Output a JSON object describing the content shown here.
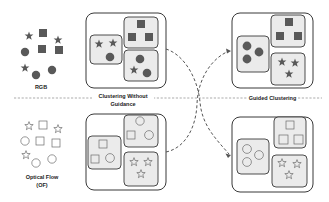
{
  "labels": {
    "rgb": "RGB",
    "optical_flow_line1": "Optical Flow",
    "optical_flow_line2": "(OF)",
    "clustering_without_line1": "Clustering Without",
    "clustering_without_line2": "Guidance",
    "guided_clustering": "Guided Clustering"
  },
  "colors": {
    "filled_shape": "#595959",
    "outline_shape": "#6b6b6b",
    "cluster_fill": "#ebebeb",
    "panel_border": "#222222",
    "dashed": "#666666"
  },
  "modalities": [
    {
      "name": "RGB",
      "style": "filled",
      "shapes": [
        "star",
        "square",
        "star",
        "circle",
        "square",
        "square",
        "star",
        "circle",
        "circle"
      ]
    },
    {
      "name": "Optical Flow (OF)",
      "style": "outline",
      "shapes": [
        "star",
        "square",
        "star",
        "circle",
        "square",
        "square",
        "star",
        "circle",
        "circle"
      ]
    }
  ],
  "panels": [
    {
      "id": "rgb-unguided",
      "clusters": [
        [
          "star",
          "star",
          "circle"
        ],
        [
          "square",
          "square",
          "square"
        ],
        [
          "circle",
          "star",
          "circle"
        ]
      ]
    },
    {
      "id": "rgb-guided",
      "clusters": [
        [
          "circle",
          "circle",
          "circle"
        ],
        [
          "square",
          "square",
          "square"
        ],
        [
          "star",
          "star",
          "star"
        ]
      ]
    },
    {
      "id": "of-unguided",
      "clusters": [
        [
          "square",
          "square",
          "circle"
        ],
        [
          "circle",
          "square",
          "circle"
        ],
        [
          "star",
          "star",
          "star"
        ]
      ]
    },
    {
      "id": "of-guided",
      "clusters": [
        [
          "circle",
          "circle",
          "circle"
        ],
        [
          "square",
          "square",
          "square"
        ],
        [
          "star",
          "star",
          "star"
        ]
      ]
    }
  ]
}
